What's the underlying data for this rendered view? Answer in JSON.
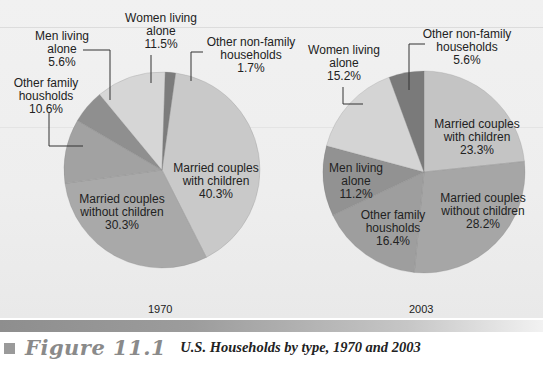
{
  "chart_data": [
    {
      "type": "pie",
      "title": "1970",
      "start_angle_deg": 8,
      "direction": "clockwise",
      "slices": [
        {
          "label": "Married couples with children",
          "value": 40.3,
          "color": "#c9c9c9"
        },
        {
          "label": "Married couples without children",
          "value": 30.3,
          "color": "#a9a9a9"
        },
        {
          "label": "Other family housholds",
          "value": 10.6,
          "color": "#a2a2a2"
        },
        {
          "label": "Men living alone",
          "value": 5.6,
          "color": "#8f8f8f"
        },
        {
          "label": "Women living alone",
          "value": 11.5,
          "color": "#d6d6d6"
        },
        {
          "label": "Other non-family households",
          "value": 1.7,
          "color": "#7c7c7c"
        }
      ]
    },
    {
      "type": "pie",
      "title": "2003",
      "start_angle_deg": 0,
      "direction": "clockwise",
      "slices": [
        {
          "label": "Married couples with children",
          "value": 23.3,
          "color": "#c4c4c4"
        },
        {
          "label": "Married couples without children",
          "value": 28.2,
          "color": "#a6a6a6"
        },
        {
          "label": "Other family housholds",
          "value": 16.4,
          "color": "#9e9e9e"
        },
        {
          "label": "Men living alone",
          "value": 11.2,
          "color": "#929292"
        },
        {
          "label": "Women living alone",
          "value": 15.2,
          "color": "#d4d4d4"
        },
        {
          "label": "Other non-family households",
          "value": 5.6,
          "color": "#7a7a7a"
        }
      ]
    }
  ],
  "pies": {
    "p1970": {
      "year": "1970",
      "labels": {
        "women_alone": "Women living\nalone\n11.5%",
        "men_alone": "Men living\nalone\n5.6%",
        "other_nonfamily": "Other non-family\nhouseholds\n1.7%",
        "other_family": "Other family\nhousholds\n10.6%",
        "married_with": "Married couples\nwith children\n40.3%",
        "married_without": "Married couples\nwithout children\n30.3%"
      }
    },
    "p2003": {
      "year": "2003",
      "labels": {
        "women_alone": "Women living\nalone\n15.2%",
        "other_nonfamily": "Other non-family\nhouseholds\n5.6%",
        "married_with": "Married couples\nwith children\n23.3%",
        "men_alone": "Men living\nalone\n11.2%",
        "married_without": "Married couples\nwithout children\n28.2%",
        "other_family": "Other family\nhousholds\n16.4%"
      }
    }
  },
  "caption": {
    "figure_label": "Figure 11.1",
    "text": "U.S. Households by type, 1970 and 2003"
  }
}
